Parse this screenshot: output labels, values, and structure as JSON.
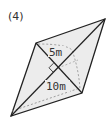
{
  "problem": {
    "number_label": "(4)",
    "figure": {
      "type": "rhombus",
      "vertices": {
        "top_left": [
          36,
          43
        ],
        "top_right": [
          105,
          19
        ],
        "bottom_right": [
          82,
          93
        ],
        "bottom_left": [
          11,
          116
        ]
      },
      "diagonal_intersection": [
        58,
        68
      ],
      "fill_color": "#ececec",
      "stroke_color": "#222222",
      "dashed_color": "#777777"
    },
    "labels": {
      "short_diagonal_half": "5m",
      "long_diagonal_half": "10m"
    }
  }
}
